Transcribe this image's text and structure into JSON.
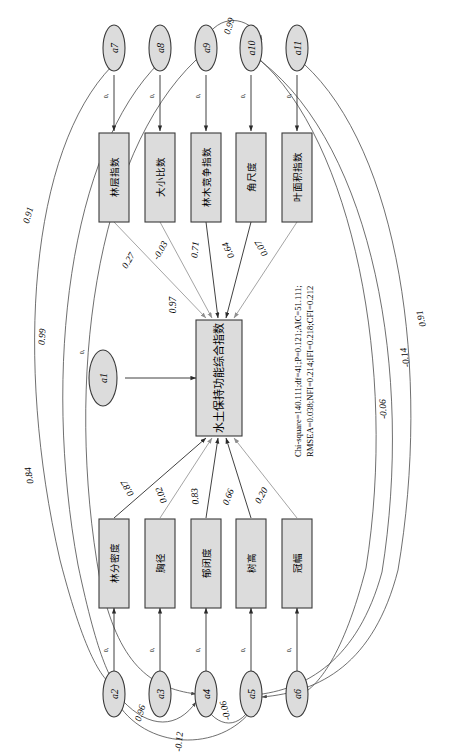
{
  "diagram": {
    "type": "structural-equation-model-path-diagram",
    "orientation": "rotated-90-clockwise",
    "latent": {
      "id": "SWC",
      "label": "水土保持功能综合指数",
      "residual_label": "0.97"
    },
    "top_indicators": [
      {
        "id": "ind1",
        "label": "林层指数",
        "coefficient": "0.27",
        "error": "a7",
        "error_value": "0,"
      },
      {
        "id": "ind2",
        "label": "大小比数",
        "coefficient": "-0.03",
        "error": "a8",
        "error_value": "0,"
      },
      {
        "id": "ind3",
        "label": "林木竞争指数",
        "coefficient": "0.71",
        "error": "a9",
        "error_value": "0,"
      },
      {
        "id": "ind4",
        "label": "角尺度",
        "coefficient": "0.64",
        "error": "a10",
        "error_value": "0,"
      },
      {
        "id": "ind5",
        "label": "叶面积指数",
        "coefficient": "0.07",
        "error": "a11",
        "error_value": "0,"
      }
    ],
    "bottom_indicators": [
      {
        "id": "ind6",
        "label": "林分密度",
        "coefficient": "0.87",
        "error": "a2",
        "error_value": "0,"
      },
      {
        "id": "ind7",
        "label": "胸径",
        "coefficient": "0.02",
        "error": "a3",
        "error_value": "0,"
      },
      {
        "id": "ind8",
        "label": "郁闭度",
        "coefficient": "0.83",
        "error": "a4",
        "error_value": "0,"
      },
      {
        "id": "ind9",
        "label": "树高",
        "coefficient": "0.66",
        "error": "a5",
        "error_value": "0,"
      },
      {
        "id": "ind10",
        "label": "冠幅",
        "coefficient": "0.20",
        "error": "a6",
        "error_value": "0,"
      }
    ],
    "latent_disturbance": {
      "id": "a1",
      "label": "a1",
      "value": "0,"
    },
    "covariances": [
      {
        "id": "cov-a9-a10",
        "label": "0.99",
        "between": [
          "a9",
          "a10"
        ],
        "side": "top"
      },
      {
        "id": "cov-left-1",
        "label": "0.91",
        "between": [
          "a7",
          "a2"
        ],
        "side": "left"
      },
      {
        "id": "cov-left-2",
        "label": "0.99",
        "between": [
          "a8",
          "a2"
        ],
        "side": "left"
      },
      {
        "id": "cov-left-3",
        "label": "0.84",
        "between": [
          "a9",
          "a4"
        ],
        "side": "left"
      },
      {
        "id": "cov-right-1",
        "label": "0.91",
        "between": [
          "a11",
          "a5"
        ],
        "side": "right"
      },
      {
        "id": "cov-right-2",
        "label": "-0.14",
        "between": [
          "a10",
          "a5"
        ],
        "side": "right"
      },
      {
        "id": "cov-right-3",
        "label": "-0.06",
        "between": [
          "a10",
          "a6"
        ],
        "side": "right"
      },
      {
        "id": "cov-bot-1",
        "label": "0.96",
        "between": [
          "a2",
          "a4"
        ],
        "side": "bottom"
      },
      {
        "id": "cov-bot-2",
        "label": "-0.06",
        "between": [
          "a4",
          "a5"
        ],
        "side": "bottom"
      },
      {
        "id": "cov-bot-3",
        "label": "-0.12",
        "between": [
          "a2",
          "a5"
        ],
        "side": "bottom"
      }
    ],
    "fit_statistics": {
      "line1": "Chi-square=140.111;df=41;P=0.121;AIC=51.111;",
      "line2": "RMSEA=0.038;NFI=0.214;IFI=0.218;CFI=0.212"
    }
  }
}
